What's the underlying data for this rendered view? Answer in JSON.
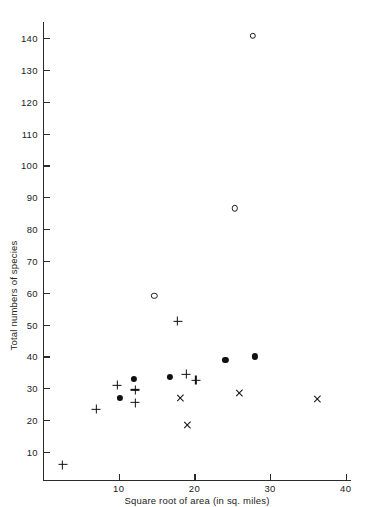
{
  "chart_data": {
    "type": "scatter",
    "title": "",
    "xlabel": "Square root of area (in sq. miles)",
    "ylabel": "Total numbers of species",
    "xlim": [
      0,
      40.7
    ],
    "ylim": [
      0,
      150
    ],
    "grid": false,
    "legend": "none",
    "xticks": [
      10,
      20,
      30,
      40
    ],
    "yticks": [
      10,
      20,
      30,
      40,
      50,
      60,
      70,
      80,
      90,
      100,
      110,
      120,
      130,
      140
    ],
    "series": [
      {
        "name": "plus-marker-series",
        "marker": "plus",
        "points": [
          {
            "x": 2.6,
            "y": 6
          },
          {
            "x": 7.0,
            "y": 23.5
          },
          {
            "x": 9.8,
            "y": 31
          },
          {
            "x": 12.2,
            "y": 29.5
          },
          {
            "x": 12.2,
            "y": 25.5
          },
          {
            "x": 17.8,
            "y": 51
          },
          {
            "x": 18.9,
            "y": 34.5
          },
          {
            "x": 20.2,
            "y": 32.5
          }
        ]
      },
      {
        "name": "filled-circle-series",
        "marker": "filled-circle",
        "points": [
          {
            "x": 10.1,
            "y": 27
          },
          {
            "x": 12.0,
            "y": 33
          },
          {
            "x": 16.8,
            "y": 33.5
          },
          {
            "x": 24.1,
            "y": 39
          },
          {
            "x": 28.0,
            "y": 40
          }
        ]
      },
      {
        "name": "cross-marker-series",
        "marker": "cross",
        "points": [
          {
            "x": 18.1,
            "y": 27
          },
          {
            "x": 19.1,
            "y": 18.5
          },
          {
            "x": 26.0,
            "y": 28.5
          },
          {
            "x": 36.2,
            "y": 26.5
          }
        ]
      },
      {
        "name": "open-circle-series",
        "marker": "open-circle",
        "points": [
          {
            "x": 14.7,
            "y": 59
          },
          {
            "x": 25.3,
            "y": 86.5
          },
          {
            "x": 27.7,
            "y": 140.7
          }
        ]
      }
    ]
  },
  "axis": {
    "x_tick_labels": [
      "10",
      "20",
      "30",
      "40"
    ],
    "y_tick_labels": [
      "10",
      "20",
      "30",
      "40",
      "50",
      "60",
      "70",
      "80",
      "90",
      "100",
      "110",
      "120",
      "130",
      "140"
    ],
    "x_title": "Square root of area (in sq. miles)",
    "y_title": "Total numbers of species"
  },
  "colors": {
    "marker": "#111111",
    "axis": "#2b2b2b",
    "background": "#ffffff",
    "text": "#232323"
  }
}
